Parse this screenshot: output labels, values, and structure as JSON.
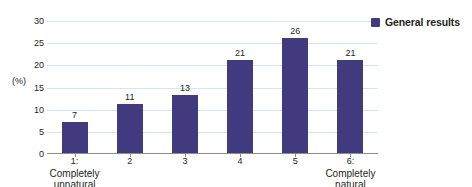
{
  "chart_data": {
    "type": "bar",
    "title": "",
    "xlabel": "",
    "ylabel": "(%)",
    "ylim": [
      0,
      30
    ],
    "yticks": [
      0,
      5,
      10,
      15,
      20,
      25,
      30
    ],
    "grid": true,
    "legend_position": "top-right",
    "categories": [
      "1: Completely unnatural",
      "2",
      "3",
      "4",
      "5",
      "6: Completely natural"
    ],
    "category_lines": [
      [
        "1:",
        "Completely",
        "unnatural"
      ],
      [
        "2"
      ],
      [
        "3"
      ],
      [
        "4"
      ],
      [
        "5"
      ],
      [
        "6:",
        "Completely",
        "natural"
      ]
    ],
    "values": [
      7,
      11,
      13,
      21,
      26,
      21
    ],
    "series": [
      {
        "name": "General results",
        "values": [
          7,
          11,
          13,
          21,
          26,
          21
        ],
        "color": "#413a7e"
      }
    ]
  },
  "axis": {
    "unit_label": "(%)",
    "tick_labels": [
      "30",
      "25",
      "20",
      "15",
      "10",
      "5",
      "0"
    ]
  },
  "legend": {
    "entries": [
      {
        "label": "General results",
        "color": "#413a7e"
      }
    ]
  },
  "colors": {
    "bar": "#413a7e",
    "gridline": "#d6e3f0",
    "axis": "#8c8c8c",
    "text": "#231f20",
    "background": "#ffffff"
  }
}
